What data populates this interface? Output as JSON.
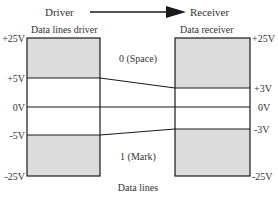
{
  "header": {
    "driver": "Driver",
    "receiver": "Receiver"
  },
  "driver_box": {
    "title": "Data lines driver",
    "levels": [
      "+25V",
      "+5V",
      "0V",
      "-5V",
      "-25V"
    ]
  },
  "receiver_box": {
    "title": "Data receiver",
    "levels": [
      "+25V",
      "+3V",
      "0V",
      "-3V",
      "-25V"
    ]
  },
  "states": {
    "space": "0 (Space)",
    "mark": "1 (Mark)"
  },
  "footer": "Data lines",
  "colors": {
    "shade": "#dcdcdc",
    "line": "#1a1a1a"
  }
}
